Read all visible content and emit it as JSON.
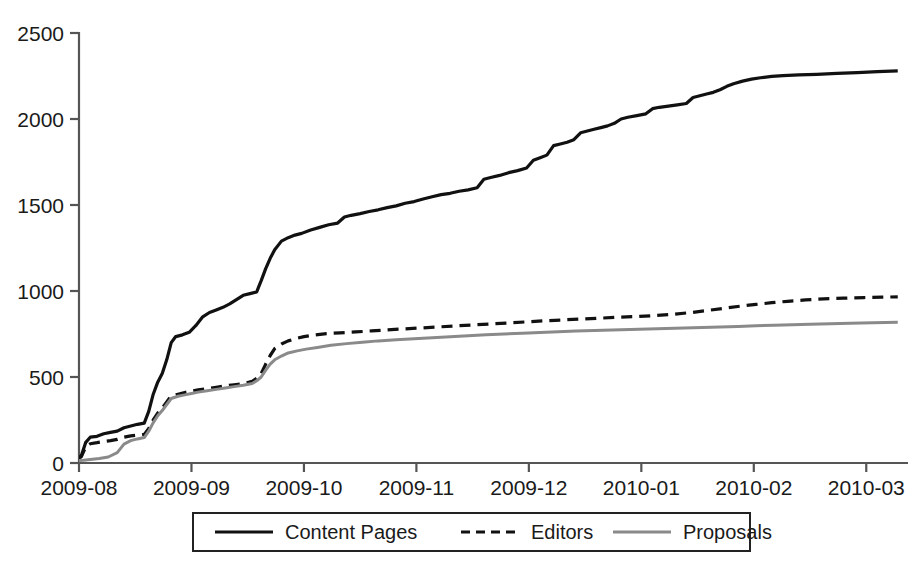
{
  "chart_data": {
    "type": "line",
    "title": "",
    "xlabel": "",
    "ylabel": "",
    "grid": false,
    "legend_position": "bottom",
    "xlim": [
      0,
      7.3
    ],
    "ylim": [
      0,
      2500
    ],
    "y_ticks": [
      "0",
      "500",
      "1000",
      "1500",
      "2000",
      "2500"
    ],
    "y_tick_values": [
      0,
      500,
      1000,
      1500,
      2000,
      2500
    ],
    "x_ticks": [
      "2009-08",
      "2009-09",
      "2009-10",
      "2009-11",
      "2009-12",
      "2010-01",
      "2010-02",
      "2010-03"
    ],
    "x_tick_values": [
      0,
      1,
      2,
      3,
      4,
      5,
      6,
      7
    ],
    "series": [
      {
        "name": "Content Pages",
        "color": "#111111",
        "style": "solid",
        "width": 3.2,
        "points": [
          [
            -0.32,
            10
          ],
          [
            -0.2,
            18
          ],
          [
            -0.1,
            25
          ],
          [
            -0.02,
            30
          ],
          [
            0.02,
            40
          ],
          [
            0.06,
            120
          ],
          [
            0.1,
            150
          ],
          [
            0.16,
            155
          ],
          [
            0.22,
            170
          ],
          [
            0.28,
            178
          ],
          [
            0.34,
            185
          ],
          [
            0.4,
            205
          ],
          [
            0.46,
            215
          ],
          [
            0.52,
            225
          ],
          [
            0.58,
            232
          ],
          [
            0.62,
            300
          ],
          [
            0.66,
            400
          ],
          [
            0.7,
            470
          ],
          [
            0.74,
            520
          ],
          [
            0.78,
            600
          ],
          [
            0.82,
            700
          ],
          [
            0.86,
            735
          ],
          [
            0.92,
            745
          ],
          [
            0.98,
            760
          ],
          [
            1.04,
            800
          ],
          [
            1.1,
            850
          ],
          [
            1.16,
            875
          ],
          [
            1.22,
            890
          ],
          [
            1.28,
            905
          ],
          [
            1.34,
            925
          ],
          [
            1.4,
            950
          ],
          [
            1.46,
            975
          ],
          [
            1.52,
            985
          ],
          [
            1.58,
            995
          ],
          [
            1.62,
            1060
          ],
          [
            1.66,
            1130
          ],
          [
            1.7,
            1190
          ],
          [
            1.74,
            1240
          ],
          [
            1.8,
            1290
          ],
          [
            1.86,
            1310
          ],
          [
            1.92,
            1325
          ],
          [
            1.98,
            1335
          ],
          [
            2.06,
            1355
          ],
          [
            2.14,
            1370
          ],
          [
            2.22,
            1385
          ],
          [
            2.3,
            1395
          ],
          [
            2.36,
            1430
          ],
          [
            2.42,
            1440
          ],
          [
            2.5,
            1450
          ],
          [
            2.58,
            1462
          ],
          [
            2.66,
            1472
          ],
          [
            2.74,
            1485
          ],
          [
            2.82,
            1495
          ],
          [
            2.9,
            1510
          ],
          [
            2.98,
            1520
          ],
          [
            3.06,
            1535
          ],
          [
            3.14,
            1548
          ],
          [
            3.22,
            1560
          ],
          [
            3.3,
            1568
          ],
          [
            3.38,
            1580
          ],
          [
            3.46,
            1588
          ],
          [
            3.54,
            1600
          ],
          [
            3.6,
            1650
          ],
          [
            3.66,
            1660
          ],
          [
            3.74,
            1672
          ],
          [
            3.82,
            1688
          ],
          [
            3.9,
            1700
          ],
          [
            3.98,
            1715
          ],
          [
            4.04,
            1760
          ],
          [
            4.1,
            1775
          ],
          [
            4.16,
            1790
          ],
          [
            4.22,
            1845
          ],
          [
            4.28,
            1855
          ],
          [
            4.34,
            1865
          ],
          [
            4.4,
            1880
          ],
          [
            4.46,
            1920
          ],
          [
            4.52,
            1930
          ],
          [
            4.58,
            1940
          ],
          [
            4.64,
            1950
          ],
          [
            4.7,
            1960
          ],
          [
            4.76,
            1975
          ],
          [
            4.82,
            2000
          ],
          [
            4.88,
            2010
          ],
          [
            4.96,
            2020
          ],
          [
            5.04,
            2030
          ],
          [
            5.1,
            2060
          ],
          [
            5.16,
            2068
          ],
          [
            5.24,
            2075
          ],
          [
            5.32,
            2082
          ],
          [
            5.4,
            2090
          ],
          [
            5.46,
            2125
          ],
          [
            5.52,
            2135
          ],
          [
            5.58,
            2145
          ],
          [
            5.64,
            2155
          ],
          [
            5.7,
            2170
          ],
          [
            5.76,
            2190
          ],
          [
            5.82,
            2205
          ],
          [
            5.9,
            2220
          ],
          [
            5.98,
            2232
          ],
          [
            6.06,
            2240
          ],
          [
            6.16,
            2248
          ],
          [
            6.26,
            2252
          ],
          [
            6.4,
            2256
          ],
          [
            6.56,
            2260
          ],
          [
            6.74,
            2265
          ],
          [
            6.92,
            2270
          ],
          [
            7.1,
            2275
          ],
          [
            7.28,
            2280
          ]
        ]
      },
      {
        "name": "Editors",
        "color": "#111111",
        "style": "dashed",
        "width": 3.2,
        "points": [
          [
            -0.32,
            8
          ],
          [
            -0.2,
            14
          ],
          [
            -0.1,
            20
          ],
          [
            -0.02,
            26
          ],
          [
            0.02,
            35
          ],
          [
            0.06,
            95
          ],
          [
            0.1,
            112
          ],
          [
            0.16,
            118
          ],
          [
            0.22,
            125
          ],
          [
            0.28,
            130
          ],
          [
            0.34,
            137
          ],
          [
            0.4,
            150
          ],
          [
            0.46,
            158
          ],
          [
            0.52,
            162
          ],
          [
            0.58,
            166
          ],
          [
            0.62,
            200
          ],
          [
            0.66,
            250
          ],
          [
            0.7,
            290
          ],
          [
            0.74,
            320
          ],
          [
            0.78,
            355
          ],
          [
            0.82,
            390
          ],
          [
            0.88,
            400
          ],
          [
            0.94,
            410
          ],
          [
            1.0,
            418
          ],
          [
            1.06,
            425
          ],
          [
            1.14,
            432
          ],
          [
            1.22,
            440
          ],
          [
            1.3,
            448
          ],
          [
            1.38,
            455
          ],
          [
            1.46,
            462
          ],
          [
            1.54,
            475
          ],
          [
            1.58,
            492
          ],
          [
            1.62,
            520
          ],
          [
            1.66,
            575
          ],
          [
            1.7,
            625
          ],
          [
            1.74,
            665
          ],
          [
            1.8,
            692
          ],
          [
            1.86,
            710
          ],
          [
            1.92,
            722
          ],
          [
            2.0,
            735
          ],
          [
            2.1,
            745
          ],
          [
            2.2,
            752
          ],
          [
            2.32,
            757
          ],
          [
            2.46,
            762
          ],
          [
            2.6,
            768
          ],
          [
            2.74,
            774
          ],
          [
            2.9,
            780
          ],
          [
            3.06,
            786
          ],
          [
            3.22,
            792
          ],
          [
            3.38,
            798
          ],
          [
            3.54,
            804
          ],
          [
            3.7,
            810
          ],
          [
            3.86,
            816
          ],
          [
            4.02,
            822
          ],
          [
            4.18,
            828
          ],
          [
            4.34,
            833
          ],
          [
            4.5,
            838
          ],
          [
            4.66,
            843
          ],
          [
            4.82,
            848
          ],
          [
            4.98,
            852
          ],
          [
            5.14,
            858
          ],
          [
            5.3,
            866
          ],
          [
            5.46,
            876
          ],
          [
            5.6,
            888
          ],
          [
            5.74,
            900
          ],
          [
            5.88,
            912
          ],
          [
            6.02,
            922
          ],
          [
            6.16,
            932
          ],
          [
            6.3,
            940
          ],
          [
            6.46,
            948
          ],
          [
            6.62,
            954
          ],
          [
            6.8,
            958
          ],
          [
            6.98,
            962
          ],
          [
            7.14,
            964
          ],
          [
            7.28,
            966
          ]
        ]
      },
      {
        "name": "Proposals",
        "color": "#8a8a8a",
        "style": "solid",
        "width": 3.0,
        "points": [
          [
            -0.32,
            4
          ],
          [
            -0.2,
            7
          ],
          [
            -0.1,
            10
          ],
          [
            -0.02,
            13
          ],
          [
            0.04,
            16
          ],
          [
            0.1,
            20
          ],
          [
            0.18,
            26
          ],
          [
            0.26,
            35
          ],
          [
            0.34,
            60
          ],
          [
            0.4,
            110
          ],
          [
            0.46,
            130
          ],
          [
            0.52,
            140
          ],
          [
            0.58,
            148
          ],
          [
            0.62,
            185
          ],
          [
            0.66,
            235
          ],
          [
            0.7,
            275
          ],
          [
            0.74,
            305
          ],
          [
            0.78,
            340
          ],
          [
            0.82,
            375
          ],
          [
            0.88,
            388
          ],
          [
            0.94,
            396
          ],
          [
            1.0,
            404
          ],
          [
            1.06,
            412
          ],
          [
            1.14,
            420
          ],
          [
            1.22,
            428
          ],
          [
            1.3,
            436
          ],
          [
            1.38,
            444
          ],
          [
            1.46,
            452
          ],
          [
            1.54,
            462
          ],
          [
            1.58,
            478
          ],
          [
            1.62,
            500
          ],
          [
            1.66,
            540
          ],
          [
            1.7,
            575
          ],
          [
            1.74,
            600
          ],
          [
            1.8,
            622
          ],
          [
            1.86,
            640
          ],
          [
            1.94,
            652
          ],
          [
            2.02,
            662
          ],
          [
            2.12,
            672
          ],
          [
            2.24,
            684
          ],
          [
            2.38,
            694
          ],
          [
            2.52,
            702
          ],
          [
            2.66,
            710
          ],
          [
            2.82,
            716
          ],
          [
            2.98,
            722
          ],
          [
            3.14,
            728
          ],
          [
            3.3,
            734
          ],
          [
            3.46,
            740
          ],
          [
            3.62,
            745
          ],
          [
            3.78,
            750
          ],
          [
            3.94,
            755
          ],
          [
            4.1,
            759
          ],
          [
            4.26,
            763
          ],
          [
            4.42,
            767
          ],
          [
            4.58,
            770
          ],
          [
            4.74,
            773
          ],
          [
            4.9,
            776
          ],
          [
            5.06,
            779
          ],
          [
            5.22,
            782
          ],
          [
            5.38,
            785
          ],
          [
            5.54,
            788
          ],
          [
            5.7,
            791
          ],
          [
            5.86,
            794
          ],
          [
            6.02,
            798
          ],
          [
            6.18,
            801
          ],
          [
            6.34,
            804
          ],
          [
            6.5,
            807
          ],
          [
            6.68,
            810
          ],
          [
            6.86,
            813
          ],
          [
            7.06,
            816
          ],
          [
            7.28,
            819
          ]
        ]
      }
    ],
    "legend": [
      {
        "label": "Content Pages",
        "color": "#111111",
        "style": "solid"
      },
      {
        "label": "Editors",
        "color": "#111111",
        "style": "dashed"
      },
      {
        "label": "Proposals",
        "color": "#8a8a8a",
        "style": "solid"
      }
    ]
  }
}
